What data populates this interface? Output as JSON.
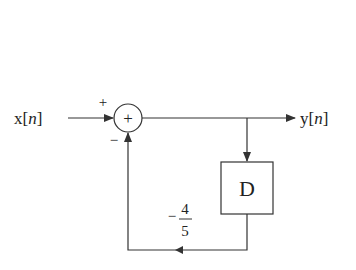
{
  "diagram": {
    "type": "block-diagram",
    "input_label": {
      "main": "x[",
      "var": "n",
      "close": "]"
    },
    "output_label": {
      "main": "y[",
      "var": "n",
      "close": "]"
    },
    "summer": {
      "symbol": "+",
      "top_sign": "+",
      "bottom_sign": "−"
    },
    "delay_block": {
      "label": "D"
    },
    "feedback_gain": {
      "sign": "−",
      "numerator": "4",
      "denominator": "5"
    },
    "line_color": "#333333"
  }
}
